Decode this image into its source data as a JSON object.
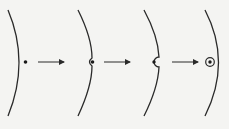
{
  "diagram": {
    "title": "",
    "stroke_color": "#2a2a2a",
    "background": "#f4f4f2",
    "stages": [
      {
        "id": 1,
        "description": "particle next to membrane",
        "curve_x_top": 8,
        "curve_bulge_x": 22,
        "particle": "dot"
      },
      {
        "id": 2,
        "description": "membrane invaginates around particle",
        "curve_x_top": 78,
        "curve_bulge_x": 92,
        "particle": "dot-in-notch"
      },
      {
        "id": 3,
        "description": "membrane nearly encloses particle",
        "curve_x_top": 144,
        "curve_bulge_x": 160,
        "particle": "dot-in-pocket"
      },
      {
        "id": 4,
        "description": "particle enclosed in vesicle",
        "curve_x_top": 205,
        "curve_bulge_x": 219,
        "particle": "dot-in-vesicle"
      }
    ],
    "arrows": [
      {
        "from_stage": 1,
        "to_stage": 2
      },
      {
        "from_stage": 2,
        "to_stage": 3
      },
      {
        "from_stage": 3,
        "to_stage": 4
      }
    ]
  }
}
